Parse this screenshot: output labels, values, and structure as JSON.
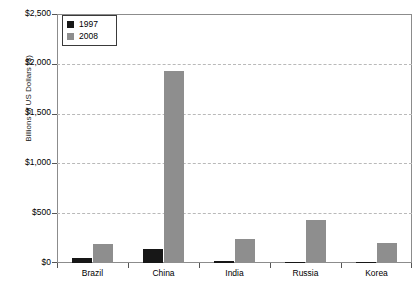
{
  "chart_data": {
    "type": "bar",
    "title": "",
    "subtitle": "",
    "xlabel": "",
    "ylabel": "Billions of US Dollars ($)",
    "categories": [
      "Brazil",
      "China",
      "India",
      "Russia",
      "Korea"
    ],
    "series": [
      {
        "name": "1997",
        "color": "#171717",
        "values": [
          50,
          145,
          20,
          15,
          15
        ]
      },
      {
        "name": "2008",
        "color": "#8e8e8e",
        "values": [
          195,
          1940,
          240,
          430,
          200
        ]
      }
    ],
    "ylim": [
      0,
      2500
    ],
    "ytick_values": [
      0,
      500,
      1000,
      1500,
      2000,
      2500
    ],
    "ytick_labels": [
      "$0",
      "$500",
      "$1,000",
      "$1,500",
      "$2,000",
      "$2,500"
    ],
    "grid": true,
    "grid_axis": "y",
    "grid_style": "dashed",
    "legend_position": "top-left-inside",
    "legend_entries": [
      "1997",
      "2008"
    ],
    "annotations": []
  },
  "legend": {
    "entries": [
      {
        "label": "1997",
        "swatch": "legend-swatch-1997"
      },
      {
        "label": "2008",
        "swatch": "legend-swatch-2008"
      }
    ]
  },
  "axes": {
    "y_title": "Billions of US Dollars ($)",
    "y_labels": [
      "$2,500",
      "$2,000",
      "$1,500",
      "$1,000",
      "$500",
      "$0"
    ],
    "x_labels": [
      "Brazil",
      "China",
      "India",
      "Russia",
      "Korea"
    ]
  },
  "colors": {
    "series_1997": "#171717",
    "series_2008": "#8e8e8e",
    "gridline": "#b9b9b9",
    "axis": "#8c8c8c",
    "background": "#ffffff",
    "text": "#000000"
  }
}
